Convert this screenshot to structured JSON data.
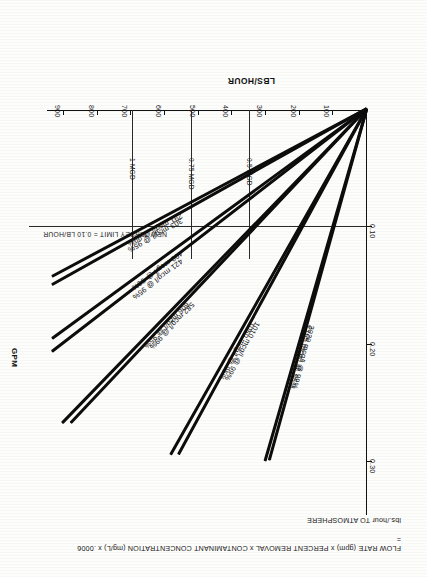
{
  "figure": {
    "title_line1": "FLOW RATE (gpm) x PERCENT REMOVAL x CONTAMINANT CONCENTRATION (mg/L) x .0006 =",
    "title_line2": "lbs./hour TO ATMOSPHERE"
  },
  "chart_data": {
    "type": "line",
    "title": "FLOW RATE (gpm) x PERCENT REMOVAL x CONTAMINANT CONCENTRATION (mg/L) x .0006 = lbs./hour TO ATMOSPHERE",
    "xlabel": "GPM",
    "ylabel": "LBS/HOUR",
    "xlim": [
      0,
      950
    ],
    "ylim": [
      0,
      0.345
    ],
    "grid": false,
    "legend": "inline-labels",
    "x_ticks": [
      100,
      200,
      300,
      400,
      500,
      600,
      700,
      800,
      900
    ],
    "x_tick_labels": [
      "100",
      "200",
      "300",
      "400",
      "500",
      "600",
      "700",
      "800",
      "900"
    ],
    "y_ticks": [
      0.1,
      0.2,
      0.3
    ],
    "y_tick_labels": [
      "0.10",
      "0.20",
      "0.30"
    ],
    "reference_lines": [
      {
        "orientation": "horizontal",
        "value": 0.1,
        "label": "NEW JERSEY LIMIT = 0.10 LB/HOUR"
      },
      {
        "orientation": "vertical",
        "value": 347,
        "label": "0.5 MGD"
      },
      {
        "orientation": "vertical",
        "value": 521,
        "label": "0.75 MGD"
      },
      {
        "orientation": "vertical",
        "value": 694,
        "label": "1 MGD"
      }
    ],
    "series": [
      {
        "name": "2020 mcg/l @ 99%",
        "label": "2020 mcg/l @ 99%",
        "concentration_mcg_l": 2020,
        "percent_removal": 99,
        "x_end": 290,
        "y_end": 0.3
      },
      {
        "name": "2105 mcg/l @ 95%",
        "label": "2105 mcg/l @ 95%",
        "concentration_mcg_l": 2105,
        "percent_removal": 95,
        "x_end": 302,
        "y_end": 0.3
      },
      {
        "name": "1010 mcg/l @ 99%",
        "label": "1010 mcg/l @ 99%",
        "concentration_mcg_l": 1010,
        "percent_removal": 99,
        "x_end": 560,
        "y_end": 0.295
      },
      {
        "name": "1050 mcg/l @ 95%",
        "label": "1050 mcg/l @ 95%",
        "concentration_mcg_l": 1050,
        "percent_removal": 95,
        "x_end": 583,
        "y_end": 0.295
      },
      {
        "name": "582 mcg/l @ 99%",
        "label": "582 mcg/l @ 99%",
        "concentration_mcg_l": 582,
        "percent_removal": 99,
        "x_end": 880,
        "y_end": 0.268
      },
      {
        "name": "606 mcg/l @ 95%",
        "label": "606 mcg/l @ 95%",
        "concentration_mcg_l": 606,
        "percent_removal": 95,
        "x_end": 905,
        "y_end": 0.268
      },
      {
        "name": "400 mcg/l @ 99%",
        "label": "400 mcg/l @ 99%",
        "concentration_mcg_l": 400,
        "percent_removal": 99,
        "x_end": 935,
        "y_end": 0.196
      },
      {
        "name": "421 mcg/l @ 95%",
        "label": "421 mcg/l @ 95%",
        "concentration_mcg_l": 421,
        "percent_removal": 95,
        "x_end": 935,
        "y_end": 0.207
      },
      {
        "name": "291 mcg/l @ 99%",
        "label": "291 mcg/l @ 99%",
        "concentration_mcg_l": 291,
        "percent_removal": 99,
        "x_end": 935,
        "y_end": 0.143
      },
      {
        "name": "303 mcg/l @ 95%",
        "label": "303 mcg/l @ 95%",
        "concentration_mcg_l": 303,
        "percent_removal": 95,
        "x_end": 935,
        "y_end": 0.15
      }
    ]
  }
}
